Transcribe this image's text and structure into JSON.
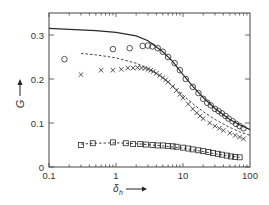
{
  "chart_data": {
    "type": "scatter",
    "title": "",
    "xlabel": "δ_h",
    "ylabel": "G",
    "xscale": "log",
    "xlim": [
      0.1,
      100
    ],
    "ylim": [
      0,
      0.33
    ],
    "grid": false,
    "legend": null,
    "x_ticks": [
      "0.1",
      "1",
      "10",
      "100"
    ],
    "y_ticks": [
      "0",
      "0.1",
      "0.2",
      "0.3"
    ],
    "series": [
      {
        "name": "solid line (theory)",
        "style": "solid-line",
        "x": [
          0.1,
          0.2,
          0.5,
          1,
          2,
          3,
          5,
          7,
          10,
          15,
          20,
          30,
          50,
          70,
          100
        ],
        "y": [
          0.315,
          0.313,
          0.31,
          0.306,
          0.298,
          0.287,
          0.262,
          0.24,
          0.21,
          0.178,
          0.158,
          0.133,
          0.108,
          0.096,
          0.085
        ]
      },
      {
        "name": "dashed line (short)",
        "style": "dashed-line",
        "x": [
          0.3,
          0.5,
          1,
          2,
          3,
          5,
          7,
          10,
          15,
          20,
          30,
          50,
          70,
          100
        ],
        "y": [
          0.258,
          0.255,
          0.248,
          0.236,
          0.224,
          0.203,
          0.185,
          0.163,
          0.14,
          0.126,
          0.108,
          0.09,
          0.08,
          0.072
        ]
      },
      {
        "name": "circles",
        "marker": "circle",
        "x": [
          0.17,
          0.9,
          1.6,
          2.5,
          3.0,
          3.5,
          4.2,
          5.0,
          6.0,
          7.5,
          9.0,
          11,
          14,
          17,
          20,
          23,
          26,
          30,
          34,
          38,
          43,
          48,
          55,
          62,
          70,
          80
        ],
        "y": [
          0.245,
          0.268,
          0.27,
          0.275,
          0.276,
          0.274,
          0.27,
          0.262,
          0.25,
          0.236,
          0.22,
          0.2,
          0.182,
          0.168,
          0.155,
          0.146,
          0.14,
          0.132,
          0.127,
          0.122,
          0.116,
          0.11,
          0.104,
          0.098,
          0.093,
          0.088
        ]
      },
      {
        "name": "crosses",
        "marker": "x",
        "x": [
          0.3,
          0.6,
          0.9,
          1.2,
          1.5,
          1.8,
          2.1,
          2.4,
          2.7,
          3.0,
          3.3,
          3.6,
          4.0,
          4.5,
          5.0,
          5.5,
          6.0,
          7.0,
          8.0,
          9.0,
          10,
          12,
          14,
          16,
          18,
          20,
          25,
          30,
          35,
          40,
          50,
          60,
          70,
          80
        ],
        "y": [
          0.21,
          0.22,
          0.22,
          0.222,
          0.225,
          0.225,
          0.226,
          0.225,
          0.224,
          0.222,
          0.22,
          0.217,
          0.213,
          0.208,
          0.203,
          0.198,
          0.193,
          0.183,
          0.174,
          0.165,
          0.157,
          0.143,
          0.132,
          0.123,
          0.116,
          0.11,
          0.1,
          0.093,
          0.088,
          0.083,
          0.077,
          0.072,
          0.068,
          0.064
        ]
      },
      {
        "name": "squares",
        "marker": "square",
        "x": [
          0.3,
          0.45,
          0.9,
          1.4,
          1.8,
          2.3,
          2.8,
          3.5,
          4.2,
          5.0,
          6.0,
          7.0,
          8.0,
          10,
          12,
          14,
          17,
          20,
          24,
          28,
          33,
          38,
          45,
          52,
          60,
          70
        ],
        "y": [
          0.05,
          0.054,
          0.056,
          0.054,
          0.052,
          0.052,
          0.051,
          0.05,
          0.049,
          0.049,
          0.048,
          0.047,
          0.046,
          0.044,
          0.042,
          0.04,
          0.038,
          0.036,
          0.034,
          0.032,
          0.03,
          0.028,
          0.026,
          0.024,
          0.023,
          0.022
        ]
      },
      {
        "name": "dashed line (lower)",
        "style": "dashed-line",
        "x": [
          0.3,
          0.5,
          1,
          2,
          3,
          5,
          10,
          20,
          30,
          50,
          70
        ],
        "y": [
          0.052,
          0.054,
          0.055,
          0.053,
          0.051,
          0.048,
          0.043,
          0.035,
          0.03,
          0.025,
          0.022
        ]
      }
    ]
  },
  "axes": {
    "x_label_main": "δ",
    "x_label_sub": "h",
    "y_label": "G"
  }
}
